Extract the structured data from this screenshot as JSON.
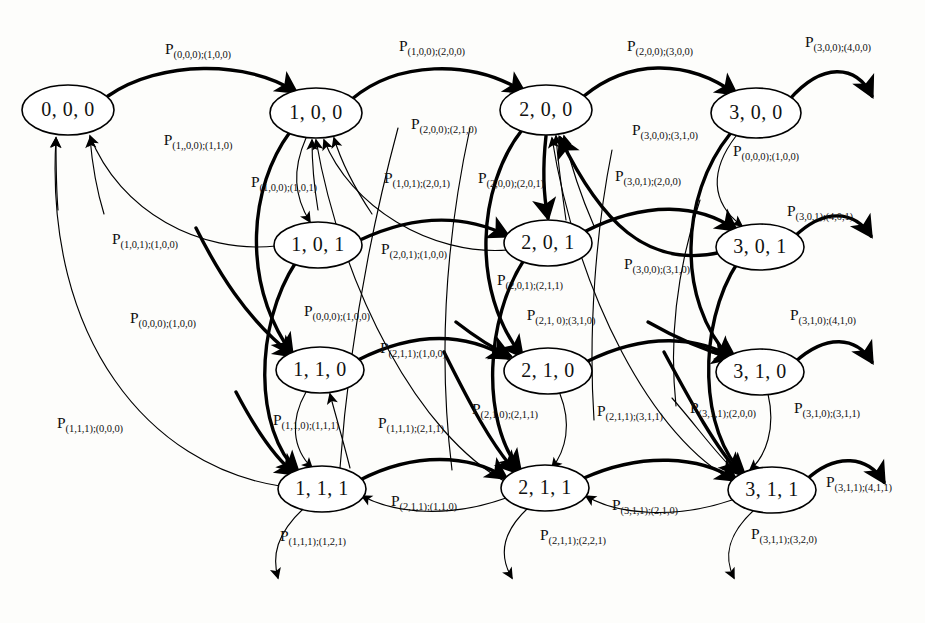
{
  "diagram": {
    "kind": "markov-state-transition-diagram",
    "width": 925,
    "height": 623,
    "background_color": "#fdfdfb",
    "stroke_color": "#000000",
    "node_fill": "#ffffff",
    "probability_symbol": "P"
  },
  "nodes": [
    {
      "id": "n000",
      "label": "0, 0, 0",
      "x": 68,
      "y": 110,
      "rx": 46,
      "ry": 25
    },
    {
      "id": "n100",
      "label": "1, 0, 0",
      "x": 316,
      "y": 113,
      "rx": 46,
      "ry": 25
    },
    {
      "id": "n200",
      "label": "2, 0, 0",
      "x": 546,
      "y": 110,
      "rx": 46,
      "ry": 25
    },
    {
      "id": "n300",
      "label": "3, 0, 0",
      "x": 756,
      "y": 113,
      "rx": 45,
      "ry": 25
    },
    {
      "id": "n101",
      "label": "1, 0, 1",
      "x": 318,
      "y": 245,
      "rx": 44,
      "ry": 23
    },
    {
      "id": "n201",
      "label": "2, 0, 1",
      "x": 548,
      "y": 243,
      "rx": 44,
      "ry": 23
    },
    {
      "id": "n301",
      "label": "3, 0, 1",
      "x": 760,
      "y": 247,
      "rx": 44,
      "ry": 23
    },
    {
      "id": "n110",
      "label": "1, 1, 0",
      "x": 320,
      "y": 370,
      "rx": 44,
      "ry": 23
    },
    {
      "id": "n210",
      "label": "2, 1, 0",
      "x": 548,
      "y": 371,
      "rx": 44,
      "ry": 23
    },
    {
      "id": "n310",
      "label": "3, 1, 0",
      "x": 760,
      "y": 372,
      "rx": 44,
      "ry": 23
    },
    {
      "id": "n111",
      "label": "1, 1, 1",
      "x": 322,
      "y": 489,
      "rx": 44,
      "ry": 23
    },
    {
      "id": "n211",
      "label": "2, 1, 1",
      "x": 545,
      "y": 488,
      "rx": 44,
      "ry": 23
    },
    {
      "id": "n311",
      "label": "3, 1, 1",
      "x": 772,
      "y": 490,
      "rx": 44,
      "ry": 23
    }
  ],
  "labels": [
    {
      "id": "L01",
      "x": 198,
      "y": 51,
      "from": "(0,0,0)",
      "to": "(1,0,0)"
    },
    {
      "id": "L02",
      "x": 432,
      "y": 48,
      "from": "(1,0,0)",
      "to": "(2,0,0)"
    },
    {
      "id": "L03",
      "x": 660,
      "y": 48,
      "from": "(2,0,0)",
      "to": "(3,0,0)"
    },
    {
      "id": "L04",
      "x": 838,
      "y": 44,
      "from": "(3,0,0)",
      "to": "(4,0,0)"
    },
    {
      "id": "L05",
      "x": 198,
      "y": 142,
      "from": "(1,,0,0)",
      "to": "(1,1,0)"
    },
    {
      "id": "L06",
      "x": 444,
      "y": 126,
      "from": "(2,0,0)",
      "to": "(2,1,0)"
    },
    {
      "id": "L07",
      "x": 665,
      "y": 132,
      "from": "(3,0,0)",
      "to": "(3,1,0)"
    },
    {
      "id": "L08",
      "x": 766,
      "y": 153,
      "from": "(0,0,0)",
      "to": "(1,0,0)"
    },
    {
      "id": "L09",
      "x": 284,
      "y": 184,
      "from": "(1,0,0)",
      "to": "(1,0,1)"
    },
    {
      "id": "L10",
      "x": 417,
      "y": 180,
      "from": "(1,0,1)",
      "to": "(2,0,1)"
    },
    {
      "id": "L11",
      "x": 511,
      "y": 180,
      "from": "(2,0,0)",
      "to": "(2,0,1)"
    },
    {
      "id": "L12",
      "x": 648,
      "y": 178,
      "from": "(3,0,1)",
      "to": "(2,0,0)"
    },
    {
      "id": "L13",
      "x": 820,
      "y": 213,
      "from": "(3,0,1)",
      "to": "(4,0,1)"
    },
    {
      "id": "L14",
      "x": 145,
      "y": 241,
      "from": "(1,0,1)",
      "to": "(1,0,0)"
    },
    {
      "id": "L15",
      "x": 414,
      "y": 251,
      "from": "(2,0,1)",
      "to": "(1,0,0)"
    },
    {
      "id": "L16",
      "x": 657,
      "y": 266,
      "from": "(3,0,0)",
      "to": "(3,1,0)"
    },
    {
      "id": "L17",
      "x": 530,
      "y": 282,
      "from": "(2,0,1)",
      "to": "(2,1,1)"
    },
    {
      "id": "L18",
      "x": 163,
      "y": 320,
      "from": "(0,0,0)",
      "to": "(1,0,0)"
    },
    {
      "id": "L19",
      "x": 337,
      "y": 313,
      "from": "(0,0,0)",
      "to": "(1,0,0)"
    },
    {
      "id": "L20",
      "x": 561,
      "y": 317,
      "from": "(2,1, 0)",
      "to": "(3,1,0)"
    },
    {
      "id": "L21",
      "x": 823,
      "y": 317,
      "from": "(3,1,0)",
      "to": "(4,1,0)"
    },
    {
      "id": "L22",
      "x": 413,
      "y": 350,
      "from": "(2,1,1)",
      "to": "(1,0,0)"
    },
    {
      "id": "L23",
      "x": 505,
      "y": 411,
      "from": "(2,1,0)",
      "to": "(2,1,1)"
    },
    {
      "id": "L24",
      "x": 630,
      "y": 413,
      "from": "(2,1,1)",
      "to": "(3,1,1)"
    },
    {
      "id": "L25",
      "x": 723,
      "y": 410,
      "from": "(3,1,1)",
      "to": "(2,0,0)"
    },
    {
      "id": "L26",
      "x": 827,
      "y": 410,
      "from": "(3,1,0)",
      "to": "(3,1,1)"
    },
    {
      "id": "L27",
      "x": 306,
      "y": 422,
      "from": "(1,1,0)",
      "to": "(1,1,1)"
    },
    {
      "id": "L28",
      "x": 411,
      "y": 425,
      "from": "(1,1,1)",
      "to": "(2,1,1)"
    },
    {
      "id": "L29",
      "x": 90,
      "y": 425,
      "from": "(1,1,1)",
      "to": "(0,0,0)"
    },
    {
      "id": "L30",
      "x": 859,
      "y": 484,
      "from": "(3,1,1)",
      "to": "(4,1,1)"
    },
    {
      "id": "L31",
      "x": 424,
      "y": 503,
      "from": "(2,1,1)",
      "to": "(1,1,0)"
    },
    {
      "id": "L32",
      "x": 645,
      "y": 507,
      "from": "(3,1,1)",
      "to": "(2,1,0)"
    },
    {
      "id": "L33",
      "x": 313,
      "y": 538,
      "from": "(1,1,1)",
      "to": "(1,2,1)"
    },
    {
      "id": "L34",
      "x": 573,
      "y": 537,
      "from": "(2,1,1)",
      "to": "(2,2,1)"
    },
    {
      "id": "L35",
      "x": 784,
      "y": 536,
      "from": "(3,1,1)",
      "to": "(3,2,0)"
    }
  ],
  "edges": [
    {
      "id": "E01",
      "weight": "thick",
      "from": "n000",
      "to": "n100",
      "label_id": "L01"
    },
    {
      "id": "E02",
      "weight": "thick",
      "from": "n100",
      "to": "n200",
      "label_id": "L02"
    },
    {
      "id": "E03",
      "weight": "thick",
      "from": "n200",
      "to": "n300",
      "label_id": "L03"
    },
    {
      "id": "E04",
      "weight": "thick",
      "from": "n300",
      "to": "outside",
      "label_id": "L04"
    },
    {
      "id": "E05",
      "weight": "thick",
      "from": "n100",
      "to": "n110",
      "label_id": "L05"
    },
    {
      "id": "E06",
      "weight": "thick",
      "from": "n200",
      "to": "n210",
      "label_id": "L06"
    },
    {
      "id": "E07",
      "weight": "thick",
      "from": "n300",
      "to": "n310",
      "label_id": "L07"
    },
    {
      "id": "E08",
      "weight": "thin",
      "from": "n300",
      "to": "n301",
      "label_id": "L08"
    },
    {
      "id": "E09",
      "weight": "thin",
      "from": "n100",
      "to": "n101",
      "label_id": "L09"
    },
    {
      "id": "E10",
      "weight": "thick",
      "from": "n101",
      "to": "n201",
      "label_id": "L10"
    },
    {
      "id": "E11",
      "weight": "thick",
      "from": "n200",
      "to": "n201",
      "label_id": "L11"
    },
    {
      "id": "E12",
      "weight": "thick",
      "from": "n301",
      "to": "n200",
      "label_id": "L12"
    },
    {
      "id": "E13",
      "weight": "thick",
      "from": "n301",
      "to": "outside",
      "label_id": "L13"
    },
    {
      "id": "E14",
      "weight": "thin",
      "from": "n101",
      "to": "n000",
      "label_id": "L14"
    },
    {
      "id": "E15",
      "weight": "thin",
      "from": "n201",
      "to": "n100",
      "label_id": "L15"
    },
    {
      "id": "E16",
      "weight": "thick",
      "from": "n300",
      "to": "n310",
      "label_id": "L16"
    },
    {
      "id": "E17",
      "weight": "thick",
      "from": "n201",
      "to": "n211",
      "label_id": "L17"
    },
    {
      "id": "E18",
      "weight": "thin",
      "from": "n000",
      "to": "n100",
      "label_id": "L18"
    },
    {
      "id": "E19",
      "weight": "thick",
      "from": "n000",
      "to": "n110",
      "label_id": "L19"
    },
    {
      "id": "E20",
      "weight": "thick",
      "from": "n210",
      "to": "n310",
      "label_id": "L20"
    },
    {
      "id": "E21",
      "weight": "thick",
      "from": "n310",
      "to": "outside",
      "label_id": "L21"
    },
    {
      "id": "E22",
      "weight": "thin",
      "from": "n211",
      "to": "n100",
      "label_id": "L22"
    },
    {
      "id": "E23",
      "weight": "thin",
      "from": "n210",
      "to": "n211",
      "label_id": "L23"
    },
    {
      "id": "E24",
      "weight": "thick",
      "from": "n211",
      "to": "n311",
      "label_id": "L24"
    },
    {
      "id": "E25",
      "weight": "thin",
      "from": "n311",
      "to": "n200",
      "label_id": "L25"
    },
    {
      "id": "E26",
      "weight": "thin",
      "from": "n310",
      "to": "n311",
      "label_id": "L26"
    },
    {
      "id": "E27",
      "weight": "thin",
      "from": "n110",
      "to": "n111",
      "label_id": "L27"
    },
    {
      "id": "E28",
      "weight": "thin",
      "from": "n111",
      "to": "n110",
      "label_id": "L28"
    },
    {
      "id": "E29",
      "weight": "thin",
      "from": "n111",
      "to": "n000",
      "label_id": "L29"
    },
    {
      "id": "E30",
      "weight": "thick",
      "from": "n311",
      "to": "outside",
      "label_id": "L30"
    },
    {
      "id": "E31",
      "weight": "thin",
      "from": "n211",
      "to": "n111",
      "label_id": "L31"
    },
    {
      "id": "E32",
      "weight": "thin",
      "from": "n311",
      "to": "n211",
      "label_id": "L32"
    },
    {
      "id": "E33",
      "weight": "thin",
      "from": "n111",
      "to": "outside",
      "label_id": "L33"
    },
    {
      "id": "E34",
      "weight": "thin",
      "from": "n211",
      "to": "outside",
      "label_id": "L34"
    },
    {
      "id": "E35",
      "weight": "thin",
      "from": "n311",
      "to": "outside",
      "label_id": "L35"
    }
  ]
}
